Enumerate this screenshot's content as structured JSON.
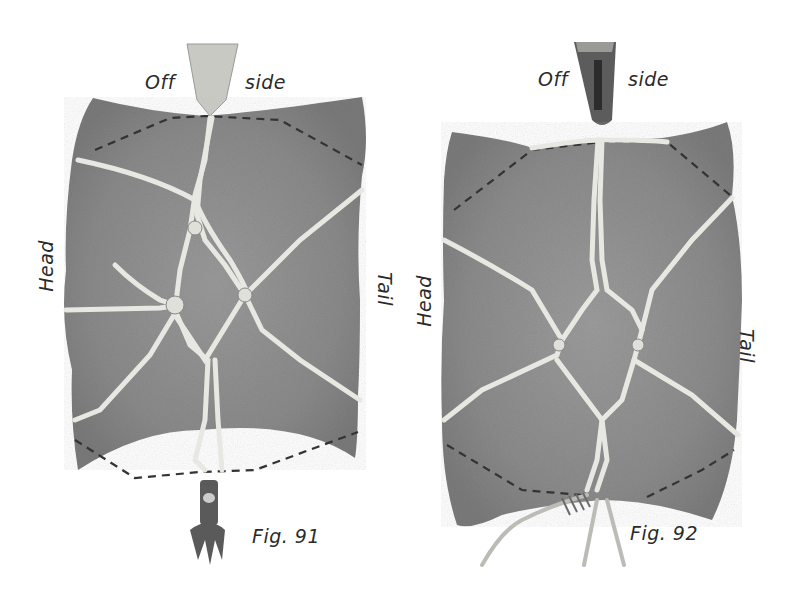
{
  "figures": [
    {
      "id": "fig91",
      "caption": "Fig. 91",
      "top_label_left": "Off",
      "top_label_right": "side",
      "left_label": "Head",
      "right_label": "Tail",
      "colors": {
        "hide": "#8c8c8c",
        "rope": "#e6e6e0",
        "dash": "#333333"
      }
    },
    {
      "id": "fig92",
      "caption": "Fig. 92",
      "top_label_left": "Off",
      "top_label_right": "side",
      "left_label": "Head",
      "right_label": "Tail",
      "colors": {
        "hide": "#8e8e8e",
        "rope": "#e6e6e0",
        "dash": "#333333"
      }
    }
  ]
}
